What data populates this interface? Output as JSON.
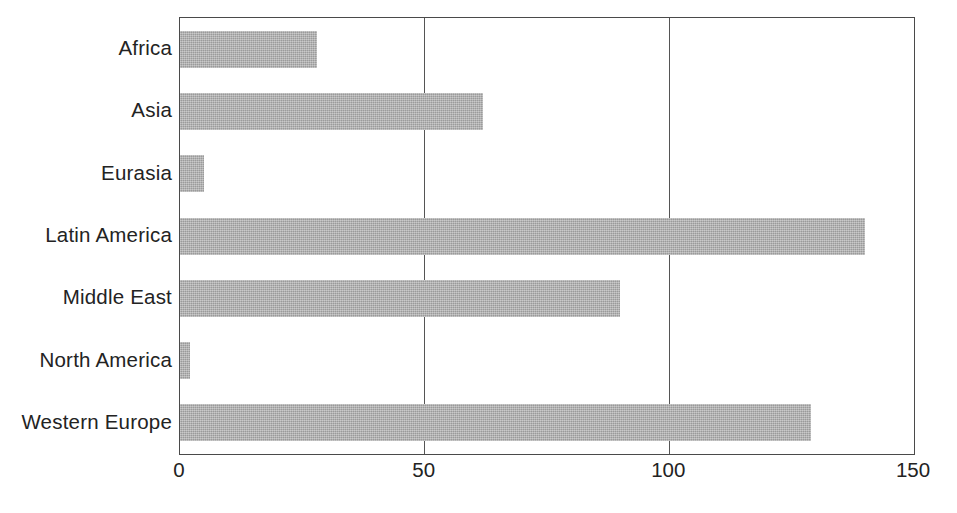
{
  "chart_data": {
    "type": "bar",
    "orientation": "horizontal",
    "title": "",
    "subtitle": "",
    "xlabel": "",
    "ylabel": "",
    "categories": [
      "Africa",
      "Asia",
      "Eurasia",
      "Latin America",
      "Middle East",
      "North America",
      "Western Europe"
    ],
    "values": [
      28,
      62,
      5,
      140,
      90,
      2,
      129
    ],
    "series": [
      {
        "name": "",
        "values": [
          28,
          62,
          5,
          140,
          90,
          2,
          129
        ]
      }
    ],
    "xlim": [
      0,
      150
    ],
    "xticks": [
      0,
      50,
      100,
      150
    ],
    "xtick_labels": [
      "0",
      "50",
      "100",
      "150"
    ],
    "grid": "vertical-at-xticks",
    "legend": "none",
    "annotations": [],
    "bar_color": "#a9a9a9",
    "axis_color": "#4a4a4a",
    "text_color": "#232323"
  }
}
